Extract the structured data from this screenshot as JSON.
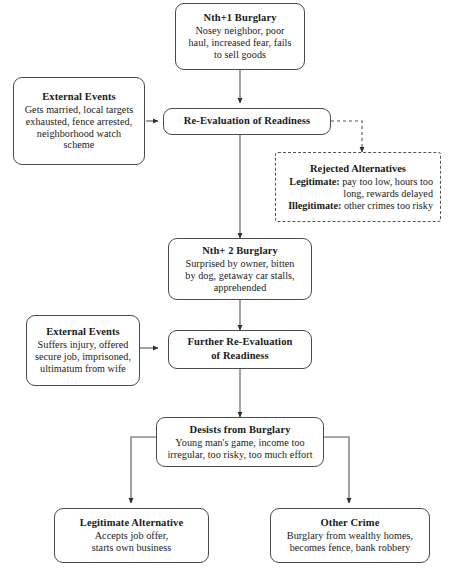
{
  "diagram": {
    "line_color": "#4a4a4a",
    "text_color": "#1a1a1a",
    "background": "#ffffff"
  },
  "nodes": {
    "nth1_burglary": {
      "title": "Nth+1 Burglary",
      "lines": [
        "Nosey neighbor, poor",
        "haul, increased fear, fails",
        "to sell goods"
      ]
    },
    "external_events_1": {
      "title": "External Events",
      "lines": [
        "Gets married, local targets",
        "exhausted, fence arrested,",
        "neighborhood watch",
        "scheme"
      ]
    },
    "re_evaluation": {
      "title": "Re-Evaluation of Readiness",
      "lines": []
    },
    "rejected_alternatives": {
      "title": "Rejected Alternatives",
      "legitimate_label": "Legitimate:",
      "legitimate_text": " pay too low, hours too",
      "legitimate_text2": "long, rewards delayed",
      "illegitimate_label": "Illegitimate:",
      "illegitimate_text": " other crimes too risky"
    },
    "nth2_burglary": {
      "title": "Nth+ 2 Burglary",
      "lines": [
        "Surprised by owner, bitten",
        "by dog, getaway car stalls,",
        "apprehended"
      ]
    },
    "external_events_2": {
      "title": "External Events",
      "lines": [
        "Suffers injury, offered",
        "secure job, imprisoned,",
        "ultimatum from wife"
      ]
    },
    "further_re_evaluation": {
      "title": "Further Re-Evaluation",
      "title2": "of Readiness",
      "lines": []
    },
    "desists": {
      "title": "Desists from Burglary",
      "lines": [
        "Young man's game, income too",
        "irregular, too risky, too much effort"
      ]
    },
    "legitimate_alternative": {
      "title": "Legitimate Alternative",
      "lines": [
        "Accepts job offer,",
        "starts own business"
      ]
    },
    "other_crime": {
      "title": "Other Crime",
      "lines": [
        "Burglary from wealthy homes,",
        "becomes fence, bank robbery"
      ]
    }
  },
  "edges": [
    {
      "name": "nth1-to-reevaluation",
      "style": "solid",
      "arrow": true
    },
    {
      "name": "external1-to-reevaluation",
      "style": "solid",
      "arrow": true
    },
    {
      "name": "reevaluation-to-rejected",
      "style": "dashed",
      "arrow": true
    },
    {
      "name": "reevaluation-to-nth2",
      "style": "solid",
      "arrow": true
    },
    {
      "name": "nth2-to-further-reevaluation",
      "style": "solid",
      "arrow": true
    },
    {
      "name": "external2-to-further-reevaluation",
      "style": "solid",
      "arrow": true
    },
    {
      "name": "further-reevaluation-to-desists",
      "style": "solid",
      "arrow": true
    },
    {
      "name": "desists-to-legitimate",
      "style": "solid",
      "arrow": true
    },
    {
      "name": "desists-to-other-crime",
      "style": "solid",
      "arrow": true
    }
  ]
}
